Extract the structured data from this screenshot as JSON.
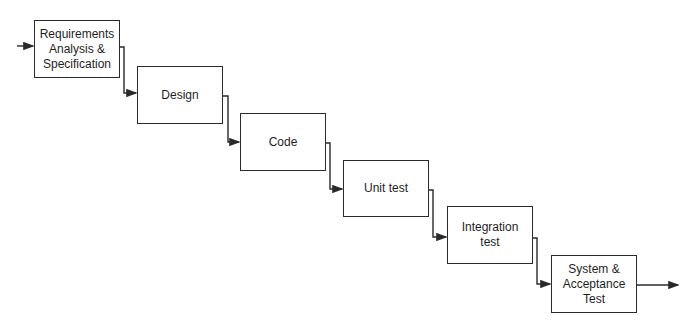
{
  "diagram": {
    "type": "waterfall-process",
    "stages": [
      {
        "id": "requirements",
        "label": "Requirements\nAnalysis &\nSpecification",
        "x": 34,
        "y": 20,
        "w": 86,
        "h": 58
      },
      {
        "id": "design",
        "label": "Design",
        "x": 137,
        "y": 66,
        "w": 86,
        "h": 58
      },
      {
        "id": "code",
        "label": "Code",
        "x": 240,
        "y": 113,
        "w": 86,
        "h": 58
      },
      {
        "id": "unit-test",
        "label": "Unit test",
        "x": 343,
        "y": 160,
        "w": 86,
        "h": 57
      },
      {
        "id": "integration-test",
        "label": "Integration\ntest",
        "x": 447,
        "y": 206,
        "w": 86,
        "h": 58
      },
      {
        "id": "system-acceptance-test",
        "label": "System &\nAcceptance\nTest",
        "x": 551,
        "y": 255,
        "w": 86,
        "h": 58
      }
    ],
    "colors": {
      "stroke": "#2a2a2a",
      "text": "#1e1e1e",
      "background": "#ffffff"
    }
  }
}
